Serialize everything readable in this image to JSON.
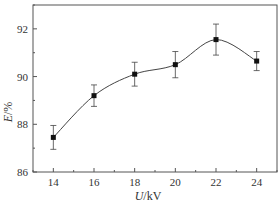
{
  "chart_data": {
    "type": "line",
    "title": "",
    "xlabel": "U/kV",
    "ylabel": "E/%",
    "xlim": [
      13,
      25
    ],
    "ylim": [
      86,
      93
    ],
    "x_ticks": [
      14,
      16,
      18,
      20,
      22,
      24
    ],
    "y_ticks": [
      86,
      88,
      90,
      92
    ],
    "grid": false,
    "legend": null,
    "series": [
      {
        "name": "E",
        "x": [
          14,
          16,
          18,
          20,
          22,
          24
        ],
        "values": [
          87.45,
          89.2,
          90.1,
          90.5,
          91.55,
          90.65
        ],
        "error": [
          0.5,
          0.45,
          0.5,
          0.55,
          0.65,
          0.4
        ],
        "marker": "square",
        "smooth": true
      }
    ]
  },
  "colors": {
    "axis": "#555555",
    "line": "#444444",
    "marker": "#111111"
  }
}
